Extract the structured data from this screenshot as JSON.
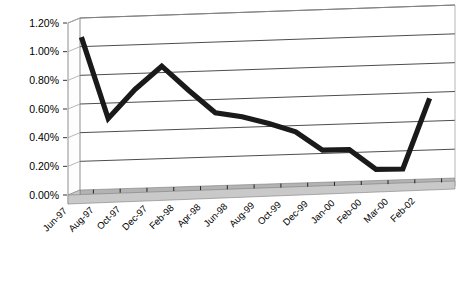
{
  "chart_data": {
    "type": "line",
    "title": "",
    "subtitle": "",
    "xlabel": "",
    "ylabel": "",
    "grid": true,
    "legend": false,
    "style_3d": true,
    "ylim": [
      0.0,
      1.2
    ],
    "ytick_step": 0.2,
    "ytick_labels": [
      "0.00%",
      "0.20%",
      "0.40%",
      "0.60%",
      "0.80%",
      "1.00%",
      "1.20%"
    ],
    "ytick_values": [
      0.0,
      0.2,
      0.4,
      0.6,
      0.8,
      1.0,
      1.2
    ],
    "categories": [
      "Jun-97",
      "Aug-97",
      "Oct-97",
      "Dec-97",
      "Feb-98",
      "Apr-98",
      "Jun-98",
      "Aug-99",
      "Oct-99",
      "Dec-99",
      "Jan-00",
      "Feb-00",
      "Mar-00",
      "Feb-02"
    ],
    "values": [
      1.1,
      0.53,
      0.73,
      0.89,
      0.72,
      0.56,
      0.53,
      0.48,
      0.42,
      0.29,
      0.29,
      0.15,
      0.15,
      0.64
    ],
    "series": [
      {
        "name": "Series 1",
        "values": [
          1.1,
          0.53,
          0.73,
          0.89,
          0.72,
          0.56,
          0.53,
          0.48,
          0.42,
          0.29,
          0.29,
          0.15,
          0.15,
          0.64
        ],
        "color": "#1a1a1a"
      }
    ],
    "value_unit": "percent",
    "colors": {
      "series": "#1a1a1a",
      "gridline": "#000000",
      "frame": "#9a9a9a",
      "floor_top": "#b3b3b3",
      "floor_front": "#c9c9c9",
      "background": "#ffffff",
      "text": "#000000"
    }
  }
}
